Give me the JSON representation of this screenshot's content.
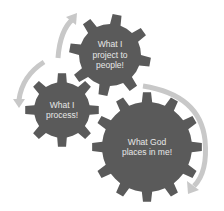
{
  "diagram": {
    "type": "cycle-gears",
    "colors": {
      "gear": "#5a5a5a",
      "arrow": "#c8c8c8",
      "text": "#e8e8e8",
      "background": "#ffffff"
    },
    "gears": [
      {
        "id": "project",
        "label_lines": [
          "What I",
          "project to",
          "people!"
        ],
        "cx": 110,
        "cy": 55,
        "r_body": 31,
        "r_teeth": 41,
        "teeth": 8,
        "rotation": 10
      },
      {
        "id": "process",
        "label_lines": [
          "What I",
          "process!"
        ],
        "cx": 62,
        "cy": 110,
        "r_body": 28,
        "r_teeth": 37,
        "teeth": 8,
        "rotation": 0
      },
      {
        "id": "god",
        "label_lines": [
          "What God",
          "places in me!"
        ],
        "cx": 147,
        "cy": 147,
        "r_body": 45,
        "r_teeth": 55,
        "teeth": 12,
        "rotation": 0
      }
    ],
    "arrows": [
      {
        "id": "arrow-top-left",
        "direction": "up"
      },
      {
        "id": "arrow-left",
        "direction": "down"
      },
      {
        "id": "arrow-right",
        "direction": "down"
      }
    ]
  }
}
